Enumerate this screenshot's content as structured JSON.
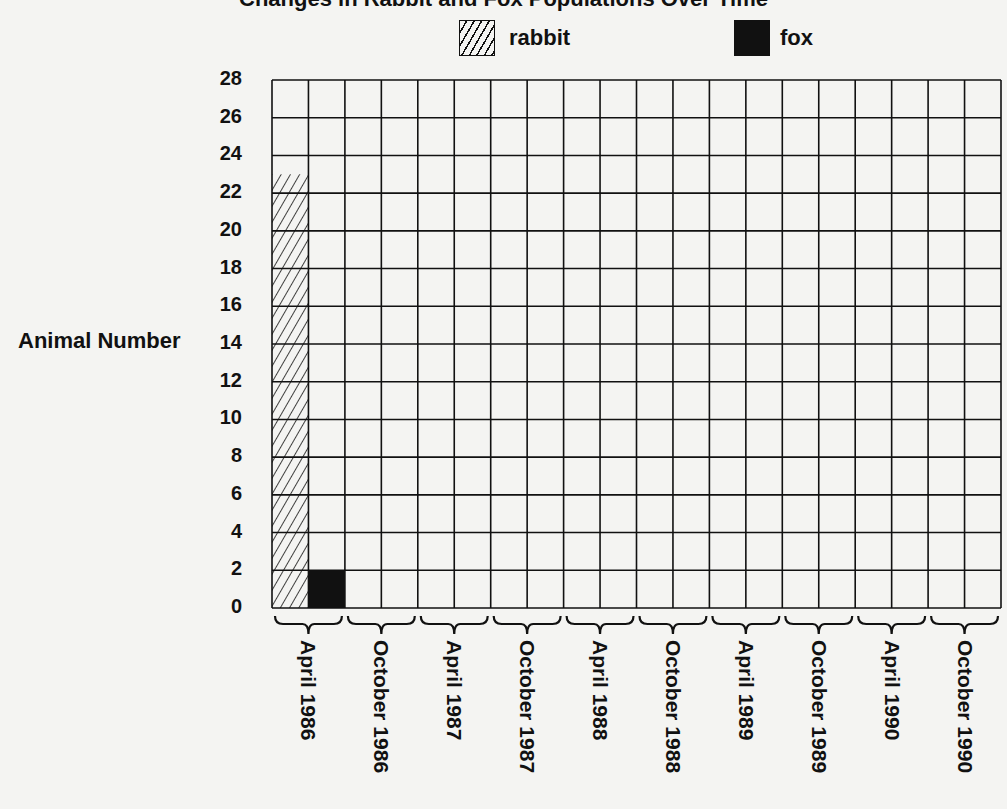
{
  "chart_data": {
    "type": "bar",
    "title": "",
    "xlabel": "",
    "ylabel": "Animal Number",
    "ylim": [
      0,
      28
    ],
    "yticks": [
      0,
      2,
      4,
      6,
      8,
      10,
      12,
      14,
      16,
      18,
      20,
      22,
      24,
      26,
      28
    ],
    "grid": true,
    "legend_position": "top",
    "categories": [
      "April 1986",
      "October 1986",
      "April 1987",
      "October 1987",
      "April 1988",
      "October 1988",
      "April 1989",
      "October 1989",
      "April 1990",
      "October 1990"
    ],
    "series": [
      {
        "name": "rabbit",
        "pattern": "hatched",
        "values": [
          23,
          null,
          null,
          null,
          null,
          null,
          null,
          null,
          null,
          null
        ]
      },
      {
        "name": "fox",
        "pattern": "solid",
        "color": "#111111",
        "values": [
          2,
          null,
          null,
          null,
          null,
          null,
          null,
          null,
          null,
          null
        ]
      }
    ]
  },
  "legend": {
    "rabbit": "rabbit",
    "fox": "fox"
  },
  "axis": {
    "ylabel": "Animal Number"
  }
}
